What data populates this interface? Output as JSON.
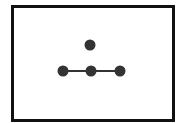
{
  "diagram": {
    "frame": {
      "stroke": "#111111"
    },
    "nodes": [
      {
        "id": "top",
        "x": 90,
        "y": 45,
        "r": 5.5,
        "fill": "#333333"
      },
      {
        "id": "left",
        "x": 63,
        "y": 71,
        "r": 5.5,
        "fill": "#333333"
      },
      {
        "id": "center",
        "x": 91,
        "y": 71,
        "r": 5.5,
        "fill": "#333333"
      },
      {
        "id": "right",
        "x": 120,
        "y": 71,
        "r": 5.5,
        "fill": "#333333"
      }
    ],
    "edges": [
      {
        "from": "left",
        "to": "center"
      },
      {
        "from": "center",
        "to": "right"
      }
    ],
    "edge_color": "#333333"
  }
}
